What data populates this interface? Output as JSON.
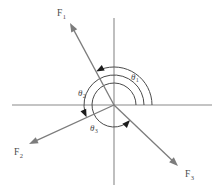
{
  "figure": {
    "type": "force-vector-diagram",
    "background_color": "#ffffff",
    "axis_color": "#8a8a8a",
    "vector_color": "#7c7c7c",
    "arc_color": "#4a4a4a",
    "label_color": "#4a4a4a",
    "origin": {
      "x": 114,
      "y": 105
    }
  },
  "axes": {
    "horizontal": {
      "x1": 12,
      "y1": 105,
      "x2": 212,
      "y2": 105
    },
    "vertical": {
      "x1": 114,
      "y1": 18,
      "x2": 114,
      "y2": 185
    }
  },
  "vectors": [
    {
      "id": "F1",
      "label": "F",
      "subscript": "1",
      "label_x": 57,
      "label_y": 16,
      "tail": {
        "x": 114,
        "y": 105
      },
      "tip": {
        "x": 70,
        "y": 23
      },
      "angle_deg": 118,
      "quadrant": "upper-left"
    },
    {
      "id": "F2",
      "label": "F",
      "subscript": "2",
      "label_x": 14,
      "label_y": 155,
      "tail": {
        "x": 114,
        "y": 105
      },
      "tip": {
        "x": 29,
        "y": 144
      },
      "angle_deg": 204,
      "quadrant": "lower-left"
    },
    {
      "id": "F3",
      "label": "F",
      "subscript": "3",
      "label_x": 185,
      "label_y": 177,
      "tail": {
        "x": 114,
        "y": 105
      },
      "tip": {
        "x": 178,
        "y": 166
      },
      "angle_deg": 317,
      "quadrant": "lower-right"
    }
  ],
  "angles": [
    {
      "id": "theta1",
      "symbol": "θ",
      "subscript": "1",
      "label_x": 131,
      "label_y": 80,
      "radius": 38,
      "start_deg": 0,
      "end_deg": 118,
      "measured_from": "positive-x-axis",
      "direction": "counterclockwise",
      "relates_to": "F1"
    },
    {
      "id": "theta2",
      "symbol": "θ",
      "subscript": "2",
      "label_x": 78,
      "label_y": 96,
      "radius": 30,
      "start_deg": 0,
      "end_deg": 204,
      "measured_from": "positive-x-axis",
      "direction": "counterclockwise",
      "relates_to": "F2"
    },
    {
      "id": "theta3",
      "symbol": "θ",
      "subscript": "3",
      "label_x": 90,
      "label_y": 131,
      "radius": 22,
      "start_deg": 0,
      "end_deg": 317,
      "measured_from": "positive-x-axis",
      "direction": "counterclockwise",
      "relates_to": "F3"
    }
  ]
}
